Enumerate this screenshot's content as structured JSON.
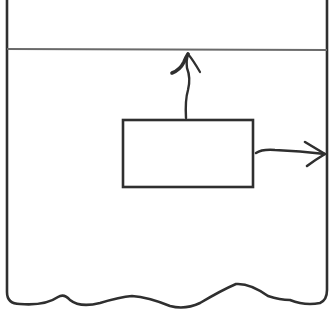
{
  "diagram": {
    "stroke_color": "#2f2f2f",
    "line_color": "#6a6a6a",
    "background": "#ffffff",
    "labels": [],
    "elements": {
      "container": {
        "left": 7,
        "right": 327,
        "top": 0,
        "bottom": 300,
        "bottom_edge": "wavy"
      },
      "boundary_line": {
        "y": 49,
        "x1": 7,
        "x2": 327
      },
      "inner_box": {
        "x": 123,
        "y": 120,
        "width": 130,
        "height": 67
      },
      "arrow_up": {
        "from": [
          187,
          118
        ],
        "to": [
          188,
          53
        ],
        "direction": "up"
      },
      "arrow_right": {
        "from": [
          256,
          152
        ],
        "to": [
          325,
          154
        ],
        "direction": "right"
      }
    }
  }
}
